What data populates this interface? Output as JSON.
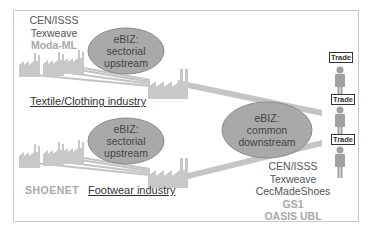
{
  "diagram": {
    "top_left_orgs": [
      {
        "label": "CEN/ISSS",
        "tone": "dark"
      },
      {
        "label": "Texweave",
        "tone": "dark"
      },
      {
        "label": "Moda-ML",
        "tone": "light"
      }
    ],
    "upstream_textile": {
      "line1": "eBIZ:",
      "line2": "sectorial",
      "line3": "upstream"
    },
    "upstream_footwear": {
      "line1": "eBIZ:",
      "line2": "sectorial",
      "line3": "upstream"
    },
    "downstream_common": {
      "line1": "eBIZ:",
      "line2": "common",
      "line3": "downstream"
    },
    "textile_industry_label": "Textile/Clothing industry",
    "footwear_industry_label": "Footwear industry",
    "shoenet_label": "SHOENET",
    "trade_figures": [
      {
        "label": "Trade"
      },
      {
        "label": "Trade"
      },
      {
        "label": "Trade"
      }
    ],
    "bottom_right_orgs": [
      {
        "label": "CEN/ISSS",
        "tone": "dark"
      },
      {
        "label": "Texweave",
        "tone": "dark"
      },
      {
        "label": "CecMadeShoes",
        "tone": "dark"
      },
      {
        "label": "GS1",
        "tone": "light"
      },
      {
        "label": "OASIS UBL",
        "tone": "light"
      }
    ],
    "colors": {
      "ellipse_fill": "#a9a9a9",
      "ellipse_stroke": "#8a8a8a",
      "connector": "#c4c4c4",
      "factory": "#c8c8c8",
      "person": "#a0a0a0"
    }
  }
}
